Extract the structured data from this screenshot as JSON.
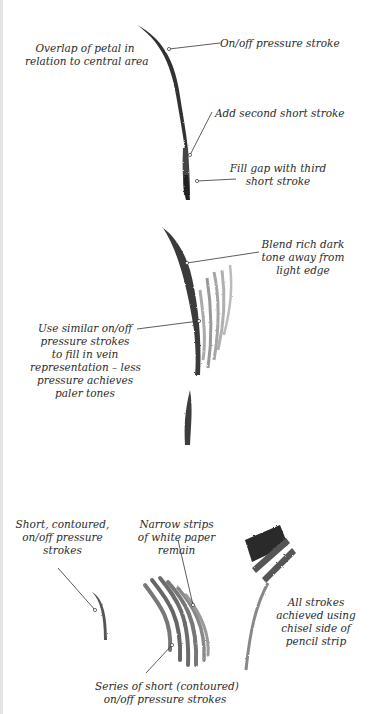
{
  "labels": {
    "overlap": [
      "Overlap of petal in",
      "relation to central area"
    ],
    "onoff": [
      "On/off pressure stroke"
    ],
    "second": [
      "Add second short stroke"
    ],
    "fillgap": [
      "Fill gap with third",
      "short stroke"
    ],
    "blend": [
      "Blend rich dark",
      "tone away from",
      "light edge"
    ],
    "similar": [
      "Use similar on/off",
      "pressure strokes",
      "to fill in vein",
      "representation – less",
      "pressure achieves",
      "paler tones"
    ],
    "short": [
      "Short, contoured,",
      "on/off pressure",
      "strokes"
    ],
    "narrow": [
      "Narrow strips",
      "of white paper",
      "remain"
    ],
    "allstrokes": [
      "All strokes",
      "achieved using",
      "chisel side of",
      "pencil strip"
    ],
    "series": [
      "Series of short (contoured)",
      "on/off pressure strokes"
    ]
  },
  "colors": {
    "graphite_dark": "#2e2e2e",
    "graphite_mid": "#7a7a7a",
    "graphite_light": "#b5b5b5",
    "paper": "#ffffff"
  }
}
